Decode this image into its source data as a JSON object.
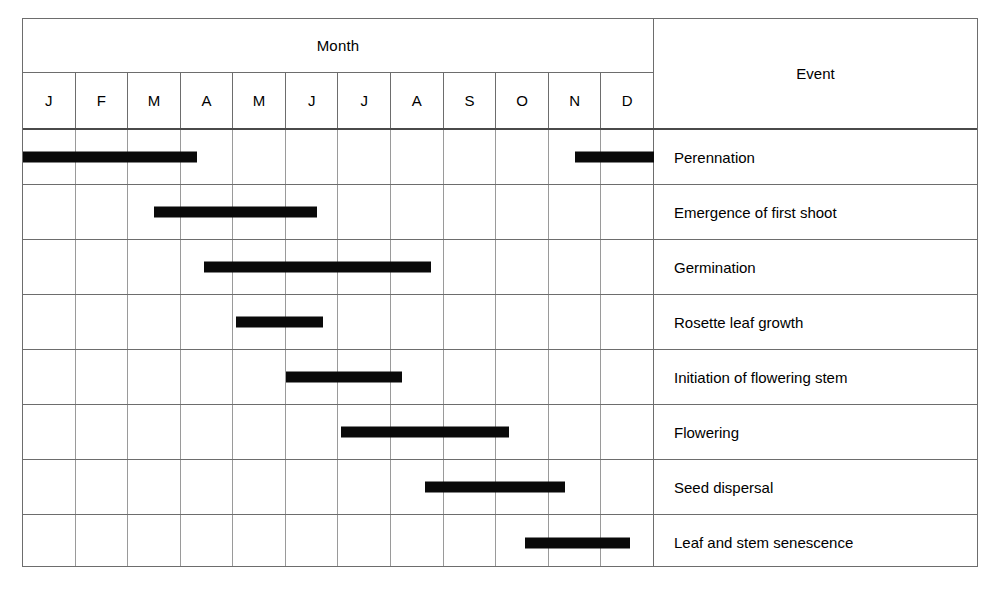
{
  "header": {
    "month_group_label": "Month",
    "event_column_label": "Event",
    "month_letters": [
      "J",
      "F",
      "M",
      "A",
      "M",
      "J",
      "J",
      "A",
      "S",
      "O",
      "N",
      "D"
    ]
  },
  "colors": {
    "bar": "#0a0a0a",
    "border": "#6d6d6d",
    "gridline": "#9a9a9a",
    "background": "#ffffff"
  },
  "chart_data": {
    "type": "bar",
    "title": "",
    "subtitle": "",
    "xlabel": "Month",
    "ylabel": "Event",
    "orientation": "horizontal",
    "grid": true,
    "legend": "none",
    "x_axis": {
      "categories": [
        "J",
        "F",
        "M",
        "A",
        "M",
        "J",
        "J",
        "A",
        "S",
        "O",
        "N",
        "D"
      ],
      "months_full": [
        "January",
        "February",
        "March",
        "April",
        "May",
        "June",
        "July",
        "August",
        "September",
        "October",
        "November",
        "December"
      ],
      "range": [
        0,
        12
      ],
      "tick_count": 12
    },
    "categories": [
      "Perennation",
      "Emergence of first shoot",
      "Germination",
      "Rosette leaf growth",
      "Initiation of flowering stem",
      "Flowering",
      "Seed dispersal",
      "Leaf and stem senescence"
    ],
    "rows": [
      {
        "event": "Perennation",
        "bars": [
          {
            "start_month": 0.0,
            "end_month": 3.3,
            "start_label": "J",
            "end_label": "A"
          },
          {
            "start_month": 10.5,
            "end_month": 12.0,
            "start_label": "N",
            "end_label": "D"
          }
        ]
      },
      {
        "event": "Emergence of first shoot",
        "bars": [
          {
            "start_month": 2.5,
            "end_month": 5.6,
            "start_label": "M",
            "end_label": "J"
          }
        ]
      },
      {
        "event": "Germination",
        "bars": [
          {
            "start_month": 3.45,
            "end_month": 7.75,
            "start_label": "A",
            "end_label": "A"
          }
        ]
      },
      {
        "event": "Rosette leaf growth",
        "bars": [
          {
            "start_month": 4.05,
            "end_month": 5.7,
            "start_label": "M",
            "end_label": "J"
          }
        ]
      },
      {
        "event": "Initiation of flowering stem",
        "bars": [
          {
            "start_month": 5.0,
            "end_month": 7.2,
            "start_label": "J",
            "end_label": "A"
          }
        ]
      },
      {
        "event": "Flowering",
        "bars": [
          {
            "start_month": 6.05,
            "end_month": 9.25,
            "start_label": "J",
            "end_label": "S"
          }
        ]
      },
      {
        "event": "Seed dispersal",
        "bars": [
          {
            "start_month": 7.65,
            "end_month": 10.3,
            "start_label": "A",
            "end_label": "N"
          }
        ]
      },
      {
        "event": "Leaf and stem senescence",
        "bars": [
          {
            "start_month": 9.55,
            "end_month": 11.55,
            "start_label": "O",
            "end_label": "D"
          }
        ]
      }
    ]
  }
}
